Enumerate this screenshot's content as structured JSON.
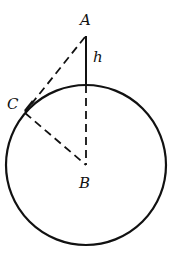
{
  "diagram": {
    "type": "geometry",
    "labels": {
      "A": "A",
      "B": "B",
      "C": "C",
      "h": "h"
    },
    "points": {
      "A": [
        86,
        35
      ],
      "B": [
        86,
        165
      ],
      "C": [
        25,
        112
      ]
    },
    "circle": {
      "center": "B",
      "radius": 80
    },
    "segments": [
      {
        "from": "A",
        "to": "circle-top",
        "style": "solid",
        "label": "h"
      },
      {
        "from": "circle-top",
        "to": "B",
        "style": "dashed"
      },
      {
        "from": "A",
        "to": "C",
        "style": "dashed"
      },
      {
        "from": "C",
        "to": "B",
        "style": "dashed"
      }
    ],
    "colors": {
      "stroke": "#111111",
      "background": "#ffffff"
    }
  }
}
